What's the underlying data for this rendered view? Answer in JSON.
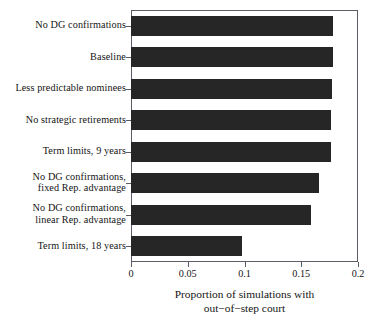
{
  "chart_data": {
    "type": "bar",
    "orientation": "horizontal",
    "title": "",
    "xlabel": "Proportion of simulations with\nout−of−step court",
    "ylabel": "",
    "xlim": [
      0,
      0.2
    ],
    "xticks": [
      "0",
      "0.05",
      "0.1",
      "0.15",
      "0.2"
    ],
    "xtick_values": [
      0,
      0.05,
      0.1,
      0.15,
      0.2
    ],
    "grid": false,
    "legend": null,
    "bar_color": "#262626",
    "axis_color": "#5c5c66",
    "categories": [
      "No DG confirmations",
      "Baseline",
      "Less predictable nominees",
      "No strategic retirements",
      "Term limits, 9 years",
      "No DG confirmations,\nfixed Rep. advantage",
      "No DG confirmations,\nlinear Rep. advantage",
      "Term limits, 18 years"
    ],
    "values": [
      0.178,
      0.178,
      0.177,
      0.176,
      0.176,
      0.166,
      0.159,
      0.098
    ]
  }
}
